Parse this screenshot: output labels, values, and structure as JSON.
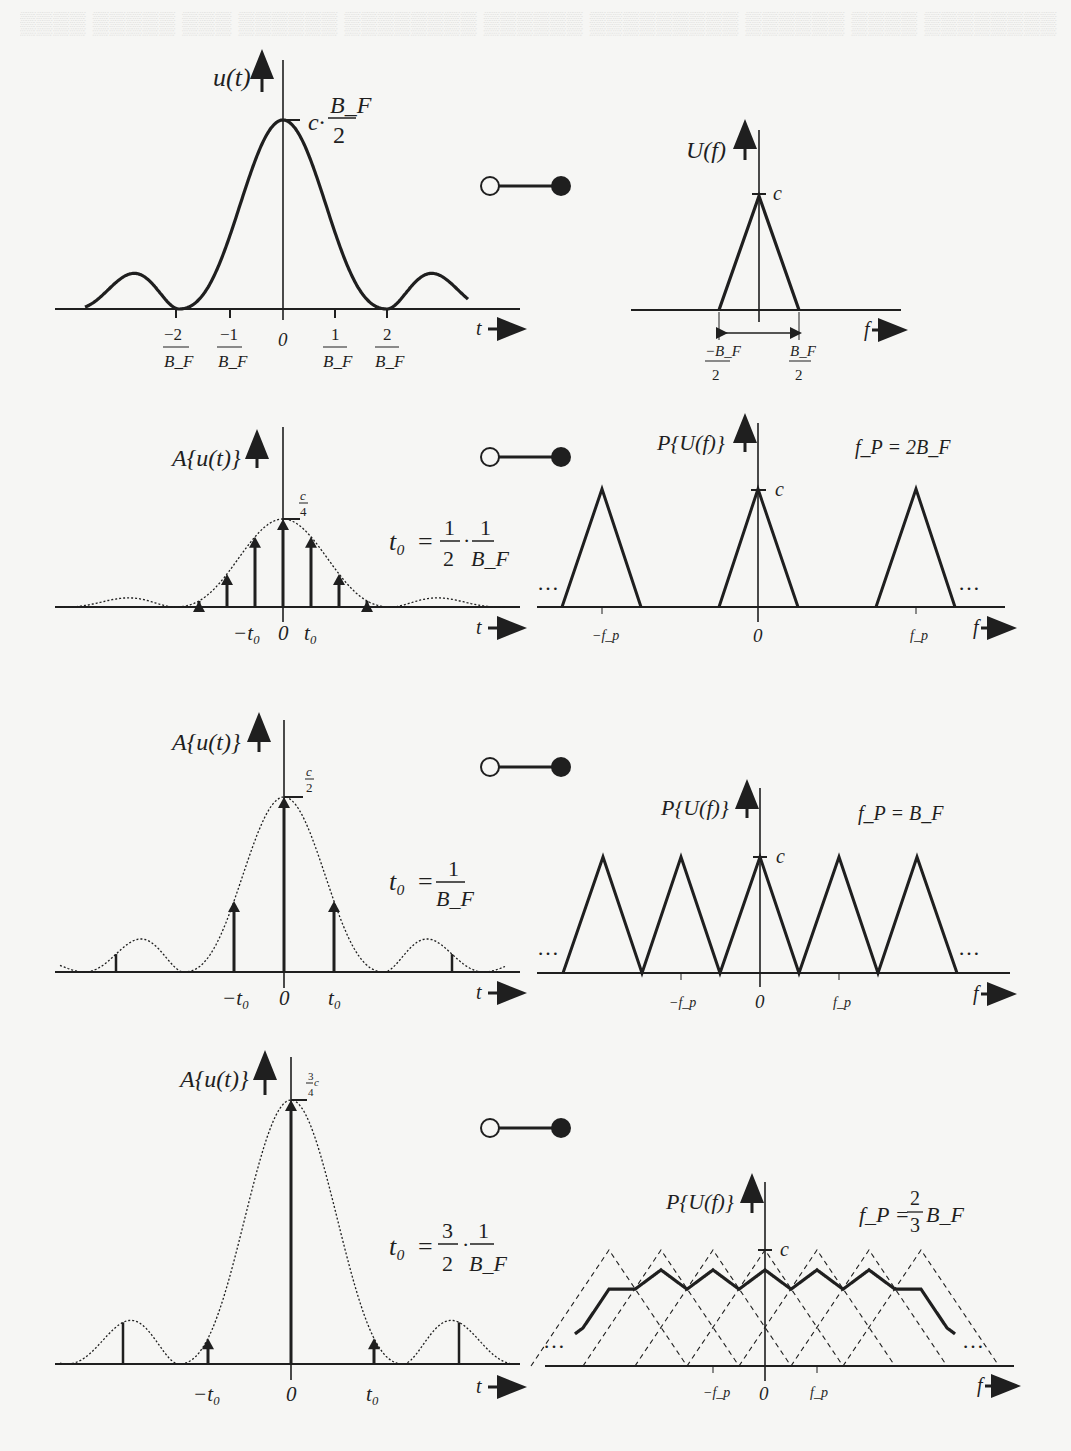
{
  "figure": {
    "connector_symbol": "transform-pair (open circle — filled circle)",
    "colors": {
      "ink": "#1f1f1f",
      "paper": "#f6f6f4",
      "bleed_text": "#e4e4e2"
    }
  },
  "rows": [
    {
      "id": "original",
      "time": {
        "ylabel": "u(t)",
        "xlabel": "t",
        "peak_label_prefix": "c·",
        "peak_label_num": "B_F",
        "peak_label_den": "2",
        "ticks": [
          {
            "num": "−2",
            "den": "B_F"
          },
          {
            "num": "−1",
            "den": "B_F"
          },
          {
            "num": "0",
            "den": ""
          },
          {
            "num": "1",
            "den": "B_F"
          },
          {
            "num": "2",
            "den": "B_F"
          }
        ]
      },
      "freq": {
        "ylabel": "U(f)",
        "xlabel": "f",
        "peak_label": "c",
        "ticks": [
          {
            "num": "−B_F",
            "den": "2"
          },
          {
            "num": "B_F",
            "den": "2"
          }
        ]
      }
    },
    {
      "id": "oversampled",
      "time": {
        "ylabel": "A{u(t)}",
        "xlabel": "t",
        "peak_num": "c",
        "peak_den": "4",
        "param_lhs": "t₀",
        "param_rhs": "= 1/2 · 1/B_F",
        "param_a_num": "1",
        "param_a_den": "2",
        "param_b_num": "1",
        "param_b_den": "B_F",
        "ticks": [
          "−t₀",
          "0",
          "t₀"
        ]
      },
      "freq": {
        "ylabel": "P{U(f)}",
        "xlabel": "f",
        "peak_label": "c",
        "fp_label": "f_P = 2B_F",
        "ellipsis": "…",
        "ticks": [
          "−f_p",
          "0",
          "f_p"
        ]
      }
    },
    {
      "id": "critical",
      "time": {
        "ylabel": "A{u(t)}",
        "xlabel": "t",
        "peak_num": "c",
        "peak_den": "2",
        "param_lhs": "t₀",
        "param_rhs": "= 1/B_F",
        "param_b_num": "1",
        "param_b_den": "B_F",
        "ticks": [
          "−t₀",
          "0",
          "t₀"
        ]
      },
      "freq": {
        "ylabel": "P{U(f)}",
        "xlabel": "f",
        "peak_label": "c",
        "fp_label": "f_P = B_F",
        "ellipsis": "…",
        "ticks": [
          "−f_p",
          "0",
          "f_p"
        ]
      }
    },
    {
      "id": "undersampled",
      "time": {
        "ylabel": "A{u(t)}",
        "xlabel": "t",
        "peak_num": "3",
        "peak_suffix": "c",
        "peak_den": "4",
        "param_lhs": "t₀",
        "param_rhs": "= 3/2 · 1/B_F",
        "param_a_num": "3",
        "param_a_den": "2",
        "param_b_num": "1",
        "param_b_den": "B_F",
        "ticks": [
          "−t₀",
          "0",
          "t₀"
        ]
      },
      "freq": {
        "ylabel": "P{U(f)}",
        "xlabel": "f",
        "peak_label": "c",
        "fp_label_lhs": "f_P =",
        "fp_num": "2",
        "fp_den": "3",
        "fp_suffix": "B_F",
        "ellipsis": "…",
        "ticks": [
          "−f_p",
          "0",
          "f_p"
        ]
      }
    }
  ],
  "chart_data": [
    {
      "type": "line",
      "title": "u(t)",
      "xlabel": "t",
      "ylabel": "u(t)",
      "shape": "sinc²",
      "peak": "c·B_F/2",
      "zeros": [
        "±2/B_F"
      ],
      "x_ticks": [
        "-2/B_F",
        "-1/B_F",
        "0",
        "1/B_F",
        "2/B_F"
      ]
    },
    {
      "type": "line",
      "title": "U(f)",
      "xlabel": "f",
      "ylabel": "U(f)",
      "shape": "triangle",
      "peak": "c",
      "support": [
        "-B_F/2",
        "B_F/2"
      ]
    },
    {
      "type": "bar",
      "title": "A{u(t)}, t0 = 1/(2B_F)",
      "x": [
        -4,
        -3,
        -2,
        -1,
        0,
        1,
        2,
        3,
        4
      ],
      "values_relative": [
        0.05,
        0.29,
        0.64,
        0.91,
        1.0,
        0.91,
        0.64,
        0.29,
        0.05
      ],
      "peak": "c/4"
    },
    {
      "type": "line",
      "title": "P{U(f)}, f_P = 2B_F",
      "shape": "periodic triangles, no overlap",
      "centers": [
        "-f_p",
        "0",
        "f_p"
      ],
      "peak": "c"
    },
    {
      "type": "bar",
      "title": "A{u(t)}, t0 = 1/B_F",
      "x": [
        -1,
        0,
        1
      ],
      "values_relative": [
        0.51,
        1.0,
        0.51
      ],
      "peak": "c/2"
    },
    {
      "type": "line",
      "title": "P{U(f)}, f_P = B_F",
      "shape": "periodic triangles, touching",
      "centers": [
        "-2f_p",
        "-f_p",
        "0",
        "f_p",
        "2f_p"
      ],
      "peak": "c"
    },
    {
      "type": "bar",
      "title": "A{u(t)}, t0 = 3/(2B_F)",
      "x": [
        -1,
        0,
        1
      ],
      "values_relative": [
        0.1,
        1.0,
        0.1
      ],
      "peak": "3c/4"
    },
    {
      "type": "line",
      "title": "P{U(f)}, f_P = 2/3 B_F",
      "shape": "overlapping triangles (aliasing), sum shown bold, components dashed",
      "peak": "c"
    }
  ]
}
